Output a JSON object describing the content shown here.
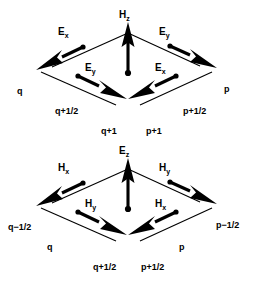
{
  "figure": {
    "background_color": "#ffffff",
    "ink_color": "#000000"
  },
  "diagrams": [
    {
      "id": "top",
      "center_field": {
        "base": "H",
        "sub": "z",
        "text": "Hz"
      },
      "edge_fields": {
        "upper_left": {
          "base": "E",
          "sub": "x",
          "text": "Ex"
        },
        "upper_right": {
          "base": "E",
          "sub": "y",
          "text": "Ey"
        },
        "lower_left": {
          "base": "E",
          "sub": "y",
          "text": "Ey"
        },
        "lower_right": {
          "base": "E",
          "sub": "x",
          "text": "Ex"
        }
      },
      "coords": {
        "left": "q",
        "right": "p",
        "lower_left": "q+1/2",
        "lower_right": "p+1/2",
        "bottom_left": "q+1",
        "bottom_right": "p+1"
      }
    },
    {
      "id": "bottom",
      "center_field": {
        "base": "E",
        "sub": "z",
        "text": "Ez"
      },
      "edge_fields": {
        "upper_left": {
          "base": "H",
          "sub": "x",
          "text": "Hx"
        },
        "upper_right": {
          "base": "H",
          "sub": "y",
          "text": "Hy"
        },
        "lower_left": {
          "base": "H",
          "sub": "y",
          "text": "Hy"
        },
        "lower_right": {
          "base": "H",
          "sub": "x",
          "text": "Hx"
        }
      },
      "coords": {
        "left": "q−1/2",
        "right": "p−1/2",
        "lower_left": "q",
        "lower_right": "p",
        "bottom_left": "q+1/2",
        "bottom_right": "p+1/2"
      }
    }
  ]
}
